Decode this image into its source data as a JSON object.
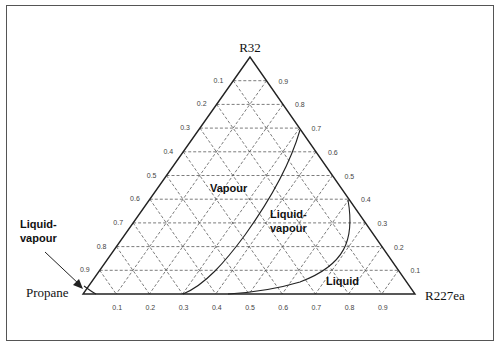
{
  "diagram": {
    "type": "ternary-phase-diagram",
    "vertices": {
      "top": "R32",
      "left": "Propane",
      "right": "R227ea"
    },
    "left_edge_ticks": [
      "0.1",
      "0.2",
      "0.3",
      "0.4",
      "0.5",
      "0.6",
      "0.7",
      "0.8",
      "0.9"
    ],
    "right_edge_ticks": [
      "0.9",
      "0.8",
      "0.7",
      "0.6",
      "0.5",
      "0.4",
      "0.3",
      "0.2",
      "0.1"
    ],
    "bottom_edge_ticks": [
      "0.1",
      "0.2",
      "0.3",
      "0.4",
      "0.5",
      "0.6",
      "0.7",
      "0.8",
      "0.9"
    ],
    "regions": {
      "vapour": "Vapour",
      "liquid_vapour": [
        "Liquid-",
        "vapour"
      ],
      "liquid": "Liquid",
      "outer_liquid_vapour": [
        "Liquid-",
        "vapour"
      ]
    },
    "colors": {
      "outline": "#222222",
      "grid": "#444444",
      "frame": "#555555"
    }
  }
}
